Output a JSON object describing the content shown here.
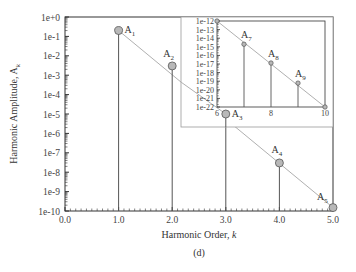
{
  "chart_data": {
    "type": "scatter",
    "subtype": "stem-log",
    "caption": "(d)",
    "xlabel": "Harmonic Order, k",
    "ylabel": "Harmonic Amplitude, A_k",
    "xlim": [
      0.0,
      5.0
    ],
    "ylim_log10": [
      -10,
      0
    ],
    "x_ticks": [
      "0.0",
      "1.0",
      "2.0",
      "3.0",
      "4.0",
      "5.0"
    ],
    "y_ticks": [
      "1e+0",
      "1e-1",
      "1e-2",
      "1e-3",
      "1e-4",
      "1e-5",
      "1e-6",
      "1e-7",
      "1e-8",
      "1e-9",
      "1e-10"
    ],
    "points": [
      {
        "label": "A1",
        "sub": "1",
        "k": 1,
        "value": 0.2
      },
      {
        "label": "A2",
        "sub": "2",
        "k": 2,
        "value": 0.003
      },
      {
        "label": "A3",
        "sub": "3",
        "k": 3,
        "value": 1e-05
      },
      {
        "label": "A4",
        "sub": "4",
        "k": 4,
        "value": 3e-08
      },
      {
        "label": "A5",
        "sub": "5",
        "k": 5,
        "value": 1.5e-10
      }
    ],
    "trend_line": {
      "from": {
        "k": 1,
        "value": 0.2
      },
      "to": {
        "k": 5,
        "value": 1.5e-10
      }
    },
    "inset": {
      "xlim": [
        6,
        10
      ],
      "ylim_log10": [
        -22,
        -12
      ],
      "x_ticks": [
        "6",
        "8",
        "10"
      ],
      "y_ticks": [
        "1e-12",
        "1e-13",
        "1e-14",
        "1e-15",
        "1e-16",
        "1e-17",
        "1e-18",
        "1e-19",
        "1e-20",
        "1e-21",
        "1e-22"
      ],
      "points": [
        {
          "label": "",
          "k": 6,
          "value": 1e-12
        },
        {
          "label": "A7",
          "sub": "7",
          "k": 7,
          "value": 2e-15
        },
        {
          "label": "A8",
          "sub": "8",
          "k": 8,
          "value": 1.3e-17
        },
        {
          "label": "A9",
          "sub": "9",
          "k": 9,
          "value": 6e-20
        },
        {
          "label": "",
          "k": 10,
          "value": 1e-22
        }
      ]
    },
    "grid": false,
    "legend": null,
    "colors": {
      "stem": "#555555",
      "marker_fill": "#b8b8b8",
      "marker_edge": "#555555",
      "trend": "#b0b0b0",
      "frame": "#333333",
      "inset_box": "#999999"
    }
  }
}
